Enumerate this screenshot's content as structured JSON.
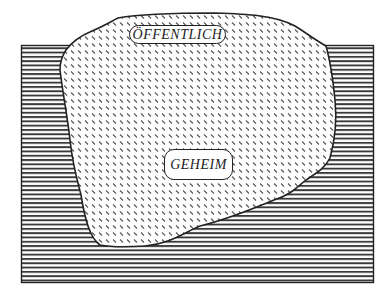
{
  "diagram": {
    "type": "nested-region-diagram",
    "outer_region": {
      "name": "background-rectangle",
      "fill_pattern": "horizontal-lines",
      "stroke": "#222222"
    },
    "inner_region": {
      "name": "irregular-blob",
      "fill_pattern": "diagonal-dashes",
      "stroke": "#222222"
    },
    "labels": {
      "public": "ÖFFENTLICH",
      "secret": "GEHEIM"
    },
    "colors": {
      "ink": "#222222",
      "background": "#ffffff"
    }
  }
}
